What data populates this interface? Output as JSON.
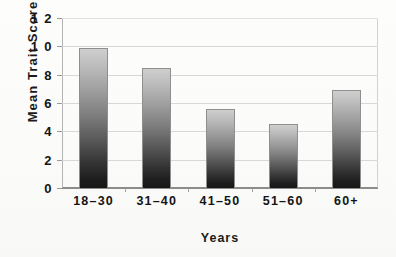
{
  "chart_data": {
    "type": "bar",
    "title": "",
    "xlabel": "Years",
    "ylabel": "Mean Trait Score",
    "categories": [
      "18–30",
      "31–40",
      "41–50",
      "51–60",
      "60+"
    ],
    "values": [
      9.85,
      8.5,
      5.6,
      4.55,
      6.9
    ],
    "ylim": [
      0,
      12
    ],
    "ytick_labels": [
      "0",
      "2",
      "4",
      "6",
      "8",
      "1 0",
      "1 2"
    ],
    "ytick_values": [
      0,
      2,
      4,
      6,
      8,
      10,
      12
    ],
    "grid": "horizontal",
    "legend": "none",
    "series": [
      {
        "name": "Mean Trait Score",
        "values": [
          9.85,
          8.5,
          5.6,
          4.55,
          6.9
        ]
      }
    ],
    "bar_style": {
      "fill": "vertical-gradient",
      "gradient_top_color": "#cfcfcf",
      "gradient_bottom_color": "#181818",
      "border_color": "#8f8f8f"
    },
    "colors": {
      "background": "#fdfdfb",
      "gridline": "#d8d8d8",
      "axis": "#8c8c8c",
      "text": "#141414"
    }
  }
}
